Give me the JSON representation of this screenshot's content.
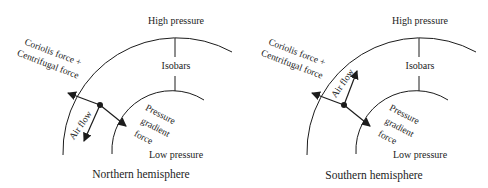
{
  "figure": {
    "background": "#ffffff",
    "line_color": "#1c1c1c",
    "panels": [
      {
        "caption": "Northern hemisphere",
        "labels": {
          "high_pressure": "High pressure",
          "isobars": "Isobars",
          "low_pressure": "Low pressure",
          "coriolis_line1": "Coriolis force +",
          "coriolis_line2": "Centrifugal force",
          "air_flow": "Air flow",
          "pressure_gradient_line1": "Pressure",
          "pressure_gradient_line2": "gradient",
          "pressure_gradient_line3": "force"
        },
        "arrows": {
          "coriolis_centrifugal": "up-left (outward)",
          "pressure_gradient": "down-right (inward)",
          "air_flow": "down-left (counterclockwise)"
        }
      },
      {
        "caption": "Southern hemisphere",
        "labels": {
          "high_pressure": "High pressure",
          "isobars": "Isobars",
          "low_pressure": "Low pressure",
          "coriolis_line1": "Coriolis force +",
          "coriolis_line2": "Centrifugal force",
          "air_flow": "Air flow",
          "pressure_gradient_line1": "Pressure",
          "pressure_gradient_line2": "gradient",
          "pressure_gradient_line3": "force"
        },
        "arrows": {
          "coriolis_centrifugal": "up-left (outward)",
          "pressure_gradient": "down-right (inward)",
          "air_flow": "up-right (clockwise)"
        }
      }
    ]
  }
}
